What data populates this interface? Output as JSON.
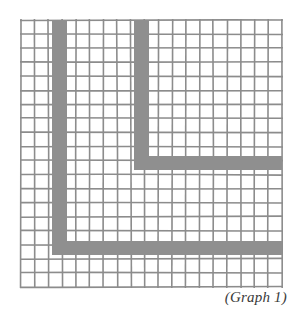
{
  "figure": {
    "caption": "(Graph 1)",
    "colors": {
      "background": "#ffffff",
      "grid_line": "#8c8c8c",
      "path_fill": "#8f8f8f",
      "caption_text": "#3a3a3a"
    },
    "grid": {
      "x0": 21,
      "y0": 20,
      "x1": 282,
      "y1": 287,
      "columns": 19,
      "rows": 19,
      "line_width": 1.6
    },
    "paths": [
      {
        "name": "outer-l-path",
        "segments": [
          {
            "x": 52,
            "y": 20,
            "w": 15,
            "h": 235
          },
          {
            "x": 52,
            "y": 241,
            "w": 230,
            "h": 14
          }
        ]
      },
      {
        "name": "inner-l-path",
        "segments": [
          {
            "x": 134,
            "y": 20,
            "w": 15,
            "h": 150
          },
          {
            "x": 134,
            "y": 156,
            "w": 148,
            "h": 14
          }
        ]
      }
    ]
  }
}
